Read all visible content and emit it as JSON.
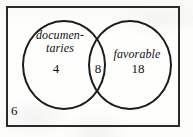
{
  "figure": {
    "type": "venn-diagram",
    "border_color": "#2b2b2b",
    "circle_color": "#1c1c1c",
    "text_color": "#111111",
    "background_color": "#fdfdfc"
  },
  "universe": {
    "outside_count": "6"
  },
  "sets": {
    "left": {
      "label_line1": "documen-",
      "label_line2": "taries",
      "label_full": "documentaries",
      "only_count": "4"
    },
    "right": {
      "label_line1": "favorable",
      "label_full": "favorable",
      "only_count": "18"
    }
  },
  "intersection": {
    "count": "8"
  },
  "chart_data": {
    "type": "venn",
    "title": "",
    "sets": [
      "documentaries",
      "favorable"
    ],
    "regions": [
      {
        "label": "documentaries only",
        "value": 4
      },
      {
        "label": "documentaries and favorable",
        "value": 8
      },
      {
        "label": "favorable only",
        "value": 18
      },
      {
        "label": "neither",
        "value": 6
      }
    ],
    "totals": {
      "documentaries": 12,
      "favorable": 26,
      "universe": 36
    }
  }
}
